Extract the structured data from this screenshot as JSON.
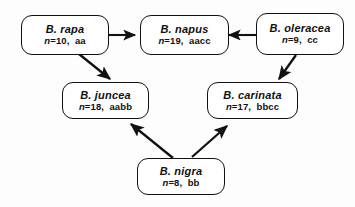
{
  "diagram": {
    "background_color": "#fdfdfd",
    "line_color": "#111111",
    "nodes": [
      {
        "id": "rapa",
        "species": "B.  rapa",
        "chromosome_label": "n",
        "chromosome_value": "=10,",
        "genome": "aa",
        "genotype_line": "n =10,  aa"
      },
      {
        "id": "napus",
        "species": "B.  napus",
        "chromosome_label": "n",
        "chromosome_value": "=19,",
        "genome": "aacc",
        "genotype_line": "n =19,  aacc"
      },
      {
        "id": "oleracea",
        "species": "B.  oleracea",
        "chromosome_label": "n",
        "chromosome_value": "=9,",
        "genome": "cc",
        "genotype_line": "n =9,  cc"
      },
      {
        "id": "juncea",
        "species": "B.  juncea",
        "chromosome_label": "n",
        "chromosome_value": "=18,",
        "genome": "aabb",
        "genotype_line": "n =18,  aabb"
      },
      {
        "id": "carinata",
        "species": "B.  carinata",
        "chromosome_label": "n",
        "chromosome_value": "=17,",
        "genome": "bbcc",
        "genotype_line": "n =17,  bbcc"
      },
      {
        "id": "nigra",
        "species": "B.  nigra",
        "chromosome_label": "n",
        "chromosome_value": "=8,",
        "genome": "bb",
        "genotype_line": "n =8,  bb"
      }
    ],
    "edges": [
      {
        "id": "rapa-to-napus",
        "from": "rapa",
        "to": "napus"
      },
      {
        "id": "oleracea-to-napus",
        "from": "oleracea",
        "to": "napus"
      },
      {
        "id": "rapa-to-juncea",
        "from": "rapa",
        "to": "juncea"
      },
      {
        "id": "oleracea-to-carinata",
        "from": "oleracea",
        "to": "carinata"
      },
      {
        "id": "nigra-to-juncea",
        "from": "nigra",
        "to": "juncea"
      },
      {
        "id": "nigra-to-carinata",
        "from": "nigra",
        "to": "carinata"
      }
    ]
  }
}
